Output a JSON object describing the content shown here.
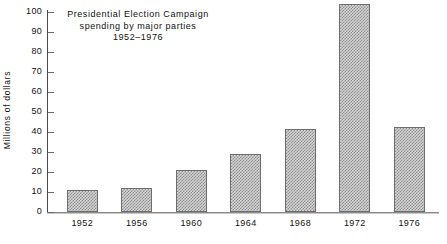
{
  "chart_data": {
    "type": "bar",
    "title_lines": [
      "Presidential  Election  Campaign",
      "spending  by  major  parties",
      "1952–1976"
    ],
    "xlabel": "",
    "ylabel": "Millions of dollars",
    "categories": [
      "1952",
      "1956",
      "1960",
      "1964",
      "1968",
      "1972",
      "1976"
    ],
    "values": [
      11,
      12,
      21,
      29,
      41.5,
      104,
      42.5
    ],
    "ylim": [
      0,
      100
    ],
    "ytick_labels": [
      "0",
      "10",
      "20",
      "30",
      "40",
      "50",
      "60",
      "70",
      "80",
      "90",
      "100"
    ],
    "ytick_values": [
      0,
      10,
      20,
      30,
      40,
      50,
      60,
      70,
      80,
      90,
      100
    ],
    "grid": false,
    "legend": null,
    "bar_fill_color": "#d4d4d4",
    "bar_pattern": "checkerboard-dither",
    "bar_border_color": "#6e6e6e",
    "axis_color": "#4a4a4a",
    "text_color": "#111111",
    "background_color": "#ffffff"
  }
}
